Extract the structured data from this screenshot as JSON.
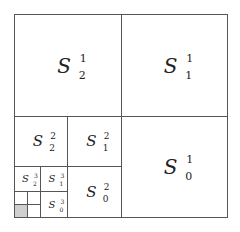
{
  "diagram": {
    "type": "recursive-quadrant-subdivision",
    "line_color": "#555555",
    "shaded_color": "#cfcfcf",
    "letter": "S",
    "level1": {
      "top_left": {
        "base": "S",
        "sup": "1",
        "sub": "2"
      },
      "top_right": {
        "base": "S",
        "sup": "1",
        "sub": "1"
      },
      "bottom_right": {
        "base": "S",
        "sup": "1",
        "sub": "0"
      }
    },
    "level2": {
      "top_left": {
        "base": "S",
        "sup": "2",
        "sub": "2"
      },
      "top_right": {
        "base": "S",
        "sup": "2",
        "sub": "1"
      },
      "bottom_right": {
        "base": "S",
        "sup": "2",
        "sub": "0"
      }
    },
    "level3": {
      "top_left": {
        "base": "S",
        "sup": "3",
        "sub": "2"
      },
      "top_right": {
        "base": "S",
        "sup": "3",
        "sub": "1"
      },
      "bottom_right": {
        "base": "S",
        "sup": "3",
        "sub": "0"
      }
    },
    "level4": {
      "shaded_cell": "bottom_left"
    }
  }
}
